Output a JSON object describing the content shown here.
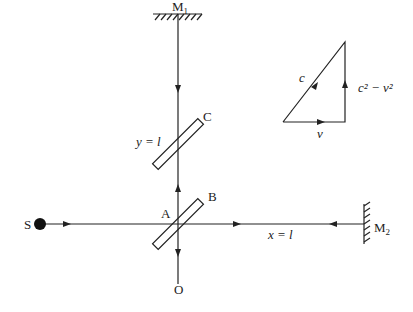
{
  "diagram": {
    "labels": {
      "mirror1": "M",
      "mirror1_sub": "1",
      "mirror2": "M",
      "mirror2_sub": "2",
      "source": "S",
      "observer": "O",
      "point_a": "A",
      "plate_b": "B",
      "plate_c": "C",
      "arm_y": "y = l",
      "arm_x": "x = l"
    },
    "velocity_triangle": {
      "hypotenuse": "c",
      "base": "v",
      "vertical": "c² − v²"
    },
    "color": "#222222"
  }
}
